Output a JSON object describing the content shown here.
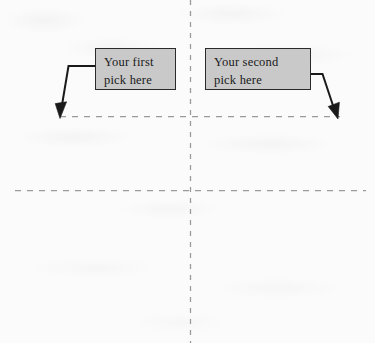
{
  "figure": {
    "type": "scanned-annotated-diagram",
    "background_color": "#fbfbfb",
    "callouts": [
      {
        "id": "first-pick",
        "line1": "Your first",
        "line2": "pick here",
        "fill_color": "#c9c9c9",
        "border_color": "#2b2b2b",
        "points_to": "upper-dashed-line-left"
      },
      {
        "id": "second-pick",
        "line1": "Your second",
        "line2": "pick here",
        "fill_color": "#c9c9c9",
        "border_color": "#2b2b2b",
        "points_to": "upper-dashed-line-right"
      }
    ],
    "guides": {
      "line_color": "#9a9a9a",
      "vertical_dashed": {
        "x": 190,
        "y_start": 0,
        "y_end": 343
      },
      "horizontal_dashed_upper": {
        "y": 116,
        "x_start": 60,
        "x_end": 340
      },
      "horizontal_dashed_lower": {
        "y": 190,
        "x_start": 15,
        "x_end": 366
      }
    },
    "arrows": [
      {
        "id": "arrow-left",
        "direction": "down-left",
        "tip_x": 60,
        "tip_y": 117,
        "color": "#1a1a1a"
      },
      {
        "id": "arrow-right",
        "direction": "down-right",
        "tip_x": 338,
        "tip_y": 118,
        "color": "#1a1a1a"
      }
    ]
  }
}
